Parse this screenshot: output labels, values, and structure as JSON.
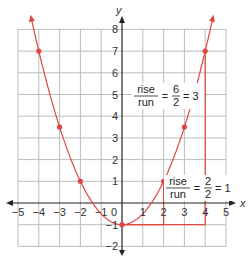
{
  "chart_data": {
    "type": "line",
    "title": "",
    "xlabel": "x",
    "ylabel": "y",
    "xlim": [
      -5,
      5
    ],
    "ylim": [
      -2,
      8
    ],
    "grid": true,
    "x_ticks": [
      "−5",
      "−4",
      "−3",
      "−2",
      "−1",
      "0",
      "1",
      "2",
      "3",
      "4",
      "5"
    ],
    "y_ticks": [
      "−2",
      "−1",
      "1",
      "2",
      "3",
      "4",
      "5",
      "6",
      "7",
      "8"
    ],
    "series": [
      {
        "name": "y = 0.5x² − 1",
        "function": "0.5*x^2 - 1",
        "color": "#e0453f",
        "points": [
          {
            "x": -4,
            "y": 7
          },
          {
            "x": -3,
            "y": 3.5
          },
          {
            "x": -2,
            "y": 1
          },
          {
            "x": 0,
            "y": -1
          },
          {
            "x": 2,
            "y": 1
          },
          {
            "x": 3,
            "y": 3.5
          },
          {
            "x": 4,
            "y": 7
          }
        ]
      }
    ],
    "annotations": [
      {
        "text_top": "rise",
        "text_bottom": "run",
        "equals": "=",
        "num": "6",
        "den": "2",
        "result": "= 3",
        "triangle": {
          "from": [
            0,
            -1
          ],
          "to": [
            4,
            7
          ]
        }
      },
      {
        "text_top": "rise",
        "text_bottom": "run",
        "equals": "=",
        "num": "2",
        "den": "2",
        "result": "= 1",
        "triangle": {
          "from": [
            0,
            -1
          ],
          "to": [
            2,
            1
          ]
        }
      }
    ]
  },
  "labels": {
    "x_axis": "x",
    "y_axis": "y"
  },
  "colors": {
    "curve": "#e0453f",
    "grid": "#bdbdbd",
    "axis": "#222222"
  }
}
